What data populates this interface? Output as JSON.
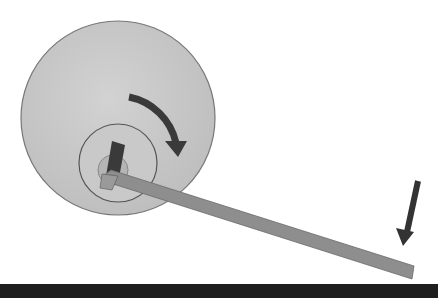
{
  "diagram": {
    "elements": {
      "lock_face": {
        "shape": "circle",
        "color": "#c8c8c8"
      },
      "cylinder_plug": {
        "shape": "circle",
        "color": "#c4c4c4"
      },
      "keyway": {
        "shape": "circle",
        "color": "#b8b8b8"
      },
      "tension_wrench": {
        "color": "#8c8c8c"
      },
      "rotation_arrow": {
        "direction": "clockwise",
        "color": "#3a3a3a"
      },
      "pressure_arrow": {
        "direction": "down",
        "color": "#333333"
      }
    },
    "colors": {
      "background": "#ffffff",
      "band": "#1e1e1e"
    }
  }
}
